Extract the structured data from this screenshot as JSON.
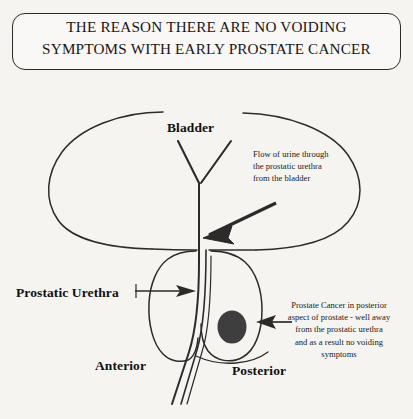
{
  "page": {
    "background_color": "#f6f4f1",
    "ink_color": "#1a1a1a",
    "width": 413,
    "height": 419
  },
  "title": {
    "line1": "THE REASON THERE ARE NO VOIDING",
    "line2": "SYMPTOMS WITH EARLY PROSTATE CANCER",
    "full": "THE REASON THERE ARE NO VOIDING SYMPTOMS WITH EARLY PROSTATE CANCER",
    "border_color": "#2b2b2b"
  },
  "labels": {
    "bladder": "Bladder",
    "prostatic_urethra": "Prostatic Urethra",
    "anterior": "Anterior",
    "posterior": "Posterior"
  },
  "annotations": {
    "flow": {
      "text": "Flow of urine through the prostatic urethra from the bladder",
      "lines": [
        "Flow of urine through",
        "the prostatic urethra",
        "from the bladder"
      ],
      "align": "left"
    },
    "cancer": {
      "text": "Prostate Cancer in posterior aspect of prostate - well away from the prostatic urethra and as a result no voiding symptoms",
      "lines": [
        "Prostate Cancer in posterior",
        "aspect of prostate - well away",
        "from the prostatic urethra",
        "and as a result no voiding",
        "symptoms"
      ],
      "align": "center"
    }
  },
  "anatomy": {
    "bladder": {
      "name": "bladder-outline",
      "fill": "none",
      "stroke": "#2b2b2b"
    },
    "prostate_left_lobe": {
      "name": "prostate-lobe-anterior",
      "fill": "none",
      "stroke": "#2b2b2b"
    },
    "prostate_right_lobe": {
      "name": "prostate-lobe-posterior",
      "fill": "none",
      "stroke": "#2b2b2b"
    },
    "urethra": {
      "name": "prostatic-urethra-channel",
      "stroke": "#2b2b2b"
    },
    "tumor": {
      "name": "prostate-cancer-tumor",
      "fill": "#3e3e3e",
      "cx": 232,
      "cy": 327,
      "rx": 14,
      "ry": 16
    }
  }
}
